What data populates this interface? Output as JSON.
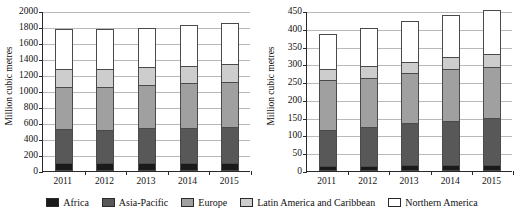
{
  "legend": {
    "items": [
      {
        "label": "Africa",
        "color": "#1a1a1a"
      },
      {
        "label": "Asia-Pacific",
        "color": "#585858"
      },
      {
        "label": "Europe",
        "color": "#a0a0a0"
      },
      {
        "label": "Latin America and Caribbean",
        "color": "#cdcdcd"
      },
      {
        "label": "Northern  America",
        "color": "#ffffff"
      }
    ]
  },
  "chart_data": [
    {
      "type": "bar",
      "stacked": true,
      "panel": "left",
      "title": "",
      "xlabel": "",
      "ylabel": "Million cubic metres",
      "ylim": [
        0,
        2000
      ],
      "ytick_step": 200,
      "yticks": [
        0,
        200,
        400,
        600,
        800,
        1000,
        1200,
        1400,
        1600,
        1800,
        2000
      ],
      "grid": true,
      "legend_position": "bottom",
      "categories": [
        "2011",
        "2012",
        "2013",
        "2014",
        "2015"
      ],
      "series": [
        {
          "name": "Africa",
          "color": "#1a1a1a",
          "values": [
            70,
            72,
            72,
            70,
            72
          ]
        },
        {
          "name": "Asia-Pacific",
          "color": "#585858",
          "values": [
            432,
            428,
            448,
            448,
            458
          ]
        },
        {
          "name": "Europe",
          "color": "#a0a0a0",
          "values": [
            538,
            545,
            540,
            568,
            570
          ]
        },
        {
          "name": "Latin America and Caribbean",
          "color": "#cdcdcd",
          "values": [
            225,
            228,
            238,
            222,
            230
          ]
        },
        {
          "name": "Northern  America",
          "color": "#ffffff",
          "values": [
            505,
            502,
            492,
            512,
            520
          ]
        }
      ],
      "totals": [
        1770,
        1775,
        1790,
        1820,
        1850
      ]
    },
    {
      "type": "bar",
      "stacked": true,
      "panel": "right",
      "title": "",
      "xlabel": "",
      "ylabel": "Million cubic metres",
      "ylim": [
        0,
        450
      ],
      "ytick_step": 50,
      "yticks": [
        0,
        50,
        100,
        150,
        200,
        250,
        300,
        350,
        400,
        450
      ],
      "grid": true,
      "legend_position": "bottom",
      "categories": [
        "2011",
        "2012",
        "2013",
        "2014",
        "2015"
      ],
      "series": [
        {
          "name": "Africa",
          "color": "#1a1a1a",
          "values": [
            10,
            10,
            11,
            11,
            11
          ]
        },
        {
          "name": "Asia-Pacific",
          "color": "#585858",
          "values": [
            101,
            111,
            121,
            127,
            135
          ]
        },
        {
          "name": "Europe",
          "color": "#a0a0a0",
          "values": [
            143,
            140,
            142,
            146,
            146
          ]
        },
        {
          "name": "Latin America and Caribbean",
          "color": "#cdcdcd",
          "values": [
            32,
            33,
            32,
            34,
            35
          ]
        },
        {
          "name": "Northern  America",
          "color": "#ffffff",
          "values": [
            98,
            108,
            116,
            120,
            125
          ]
        }
      ],
      "totals": [
        384,
        402,
        422,
        438,
        452
      ]
    }
  ]
}
